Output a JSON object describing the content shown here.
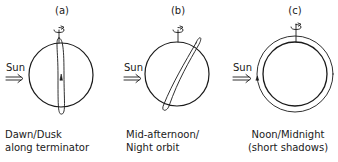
{
  "diagram": {
    "stroke_color": "#1a1a1a",
    "background": "#ffffff",
    "panels": [
      {
        "id": "a",
        "label": "(a)",
        "sun_label": "Sun",
        "sun_arrow": "double-arrow-right",
        "caption_line1": "Dawn/Dusk",
        "caption_line2": "along terminator",
        "orbit": "polar orbit seen edge-on along terminator"
      },
      {
        "id": "b",
        "label": "(b)",
        "sun_label": "Sun",
        "sun_arrow": "double-arrow-right",
        "caption_line1": "Mid-afternoon/",
        "caption_line2": "Night orbit",
        "orbit": "tilted elliptical orbit"
      },
      {
        "id": "c",
        "label": "(c)",
        "sun_label": "Sun",
        "sun_arrow": "double-arrow-right",
        "caption_line1": "Noon/Midnight",
        "caption_line2": "(short shadows)",
        "orbit": "orbit seen face-on as outer ring"
      }
    ]
  }
}
